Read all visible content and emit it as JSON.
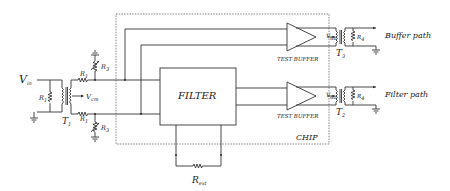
{
  "diagram": {
    "labels": {
      "vin": "V",
      "vin_sub": "in",
      "vcm": "V",
      "vcm_sub": "cm",
      "r1": "R",
      "r1_sub": "1",
      "r3": "R",
      "r3_sub": "3",
      "r4": "R",
      "r4_sub": "4",
      "t1": "T",
      "t1_sub": "1",
      "t2": "T",
      "t2_sub": "2",
      "t3": "T",
      "t3_sub": "3",
      "vdd": "V",
      "vdd_sub": "dd",
      "rext": "R",
      "rext_sub": "ext",
      "filter": "FILTER",
      "test_buffer_top": "TEST BUFFER",
      "test_buffer_bottom": "TEST BUFFER",
      "chip": "CHIP",
      "buffer_path": "Buffer path",
      "filter_path": "Filter path"
    },
    "components": [
      {
        "id": "T1",
        "type": "transformer"
      },
      {
        "id": "T2",
        "type": "transformer"
      },
      {
        "id": "T3",
        "type": "transformer"
      },
      {
        "id": "R1",
        "type": "resistor",
        "count": 3
      },
      {
        "id": "R3",
        "type": "variable-resistor",
        "count": 2
      },
      {
        "id": "R4",
        "type": "resistor",
        "count": 2
      },
      {
        "id": "Rext",
        "type": "resistor"
      },
      {
        "id": "FILTER",
        "type": "block"
      },
      {
        "id": "TEST BUFFER",
        "type": "amplifier",
        "count": 2
      }
    ]
  }
}
